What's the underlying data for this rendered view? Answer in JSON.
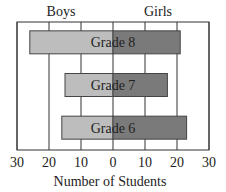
{
  "chart_data": {
    "type": "bar",
    "orientation": "horizontal",
    "subtype": "back-to-back",
    "title": "",
    "xlabel": "Number of Students",
    "ylabel": "",
    "side_labels": {
      "left": "Boys",
      "right": "Girls"
    },
    "categories": [
      "Grade 8",
      "Grade 7",
      "Grade 6"
    ],
    "series": [
      {
        "name": "Boys",
        "side": "left",
        "color": "#bdbdbd",
        "values": [
          26,
          15,
          16
        ]
      },
      {
        "name": "Girls",
        "side": "right",
        "color": "#7a7a7a",
        "values": [
          21,
          17,
          23
        ]
      }
    ],
    "xlim": [
      -30,
      30
    ],
    "xticks": [
      -30,
      -20,
      -10,
      0,
      10,
      20,
      30
    ],
    "xtick_labels": [
      "30",
      "20",
      "10",
      "0",
      "10",
      "20",
      "30"
    ],
    "grid": true,
    "legend": "none"
  }
}
